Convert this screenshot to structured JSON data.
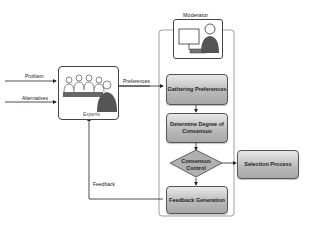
{
  "diagram": {
    "moderator": {
      "label": "Moderator"
    },
    "experts": {
      "label": "Experts"
    },
    "inputs": [
      {
        "label": "Problem"
      },
      {
        "label": "Alternatives"
      }
    ],
    "edges": {
      "preferences": "Preferences",
      "feedback": "Feedback"
    },
    "steps": [
      {
        "id": "gathering",
        "label": "Gathering Preferences",
        "shape": "rect"
      },
      {
        "id": "degree",
        "label": "Determine Degree of Consensus",
        "shape": "rect"
      },
      {
        "id": "control",
        "label": "Consensus Control",
        "shape": "diamond"
      },
      {
        "id": "feedback",
        "label": "Feedback Generation",
        "shape": "rect"
      }
    ],
    "output": {
      "label": "Selection Process"
    },
    "colors": {
      "box_fill": "#b8b8b8",
      "line": "#333333",
      "person": "#555555"
    }
  }
}
